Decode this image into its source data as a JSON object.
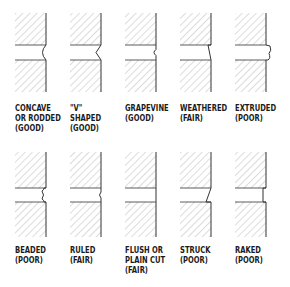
{
  "diagram": {
    "colors": {
      "hatch": "#9a9a9a",
      "outline": "#333333",
      "text": "#1a1a1a",
      "background": "#ffffff"
    },
    "rows": [
      {
        "joints": [
          {
            "id": "concave",
            "label_lines": [
              "CONCAVE",
              "OR RODDED",
              "(GOOD)"
            ],
            "profile": "concave"
          },
          {
            "id": "v-shaped",
            "label_lines": [
              "\"V\"",
              "SHAPED",
              "(GOOD)"
            ],
            "profile": "v"
          },
          {
            "id": "grapevine",
            "label_lines": [
              "GRAPEVINE",
              "(GOOD)"
            ],
            "profile": "grapevine"
          },
          {
            "id": "weathered",
            "label_lines": [
              "WEATHERED",
              "(FAIR)"
            ],
            "profile": "weathered"
          },
          {
            "id": "extruded",
            "label_lines": [
              "EXTRUDED",
              "(POOR)"
            ],
            "profile": "extruded"
          }
        ]
      },
      {
        "joints": [
          {
            "id": "beaded",
            "label_lines": [
              "BEADED",
              "(POOR)"
            ],
            "profile": "beaded"
          },
          {
            "id": "ruled",
            "label_lines": [
              "RULED",
              "(FAIR)"
            ],
            "profile": "ruled"
          },
          {
            "id": "flush",
            "label_lines": [
              "FLUSH OR",
              "PLAIN CUT",
              "(FAIR)"
            ],
            "profile": "flush"
          },
          {
            "id": "struck",
            "label_lines": [
              "STRUCK",
              "(POOR)"
            ],
            "profile": "struck"
          },
          {
            "id": "raked",
            "label_lines": [
              "RAKED",
              "(POOR)"
            ],
            "profile": "raked"
          }
        ]
      }
    ]
  }
}
